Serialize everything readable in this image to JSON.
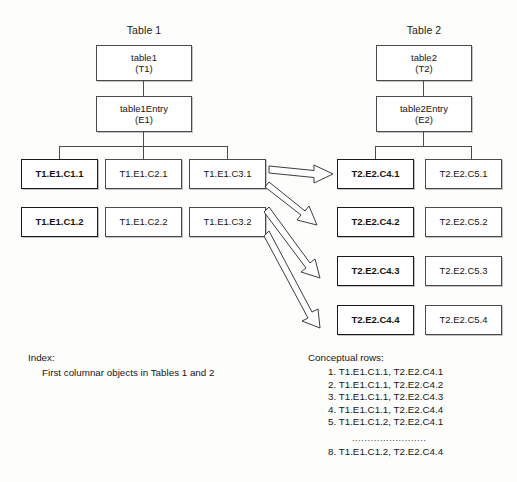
{
  "canvas": {
    "width": 517,
    "height": 482,
    "background": "#fdfdfb",
    "line_color": "#4a4a4a",
    "text_color": "#141414"
  },
  "diagram": {
    "type": "tree-mapping-diagram",
    "tables": [
      {
        "id": "table1",
        "title": "Table 1",
        "root": {
          "line1": "table1",
          "line2": "(T1)"
        },
        "entry": {
          "line1": "table1Entry",
          "line2": "(E1)"
        },
        "columns": [
          {
            "id": "c1",
            "bold": true,
            "cells": [
              "T1.E1.C1.1",
              "T1.E1.C1.2"
            ]
          },
          {
            "id": "c2",
            "bold": false,
            "cells": [
              "T1.E1.C2.1",
              "T1.E1.C2.2"
            ]
          },
          {
            "id": "c3",
            "bold": false,
            "cells": [
              "T1.E1.C3.1",
              "T1.E1.C3.2"
            ]
          }
        ]
      },
      {
        "id": "table2",
        "title": "Table 2",
        "root": {
          "line1": "table2",
          "line2": "(T2)"
        },
        "entry": {
          "line1": "table2Entry",
          "line2": "(E2)"
        },
        "columns": [
          {
            "id": "c4",
            "bold": true,
            "cells": [
              "T2.E2.C4.1",
              "T2.E2.C4.2",
              "T2.E2.C4.3",
              "T2.E2.C4.4"
            ]
          },
          {
            "id": "c5",
            "bold": false,
            "cells": [
              "T2.E2.C5.1",
              "T2.E2.C5.2",
              "T2.E2.C5.3",
              "T2.E2.C5.4"
            ]
          }
        ]
      }
    ],
    "mapping_arrows": [
      {
        "from": "T1.E1.C3.1",
        "to": "T2.E2.C4.1"
      },
      {
        "from": "T1.E1.C3.1",
        "to": "T2.E2.C4.2"
      },
      {
        "from": "T1.E1.C3.2",
        "to": "T2.E2.C4.3"
      },
      {
        "from": "T1.E1.C3.2",
        "to": "T2.E2.C4.4"
      }
    ]
  },
  "index_caption": {
    "heading": "Index:",
    "line": "First columnar objects in Tables 1 and 2"
  },
  "rows_caption": {
    "heading": "Conceptual rows:",
    "items": [
      "1. T1.E1.C1.1, T2.E2.C4.1",
      "2. T1.E1.C1.1, T2.E2.C4.2",
      "3. T1.E1.C1.1, T2.E2.C4.3",
      "4. T1.E1.C1.1, T2.E2.C4.4",
      "5. T1.E1.C1.2, T2.E2.C4.1"
    ],
    "ellipsis": "........................",
    "last_item": "8. T1.E1.C1.2, T2.E2.C4.4"
  }
}
